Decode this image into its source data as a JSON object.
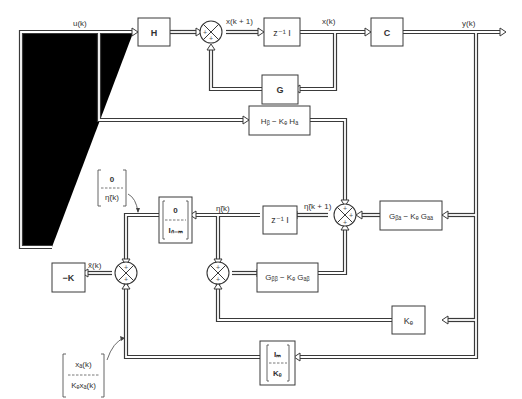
{
  "diagram": {
    "type": "block-diagram",
    "title": "",
    "blocks": {
      "H": "H",
      "zinv_top": "z⁻¹ I",
      "C": "C",
      "G": "G",
      "Hb_KeHa": "Hᵦ − Kₑ Hₐ",
      "Gba_KeGaa": "Gᵦₐ − Kₑ Gₐₐ",
      "zinv_mid": "z⁻¹ I",
      "Gbb_KeGab": "Gᵦᵦ − Kₑ Gₐᵦ",
      "minusK": "−K",
      "Ke": "Kₑ",
      "stack0I_top": "0",
      "stack0I_bot": "Iₙ₋ₘ",
      "stackIK_top": "Iₘ",
      "stackIK_bot": "Kₑ"
    },
    "signals": {
      "u": "u(k)",
      "x_next": "x(k + 1)",
      "x": "x(k)",
      "y": "y(k)",
      "eta_next": "η̃(k + 1)",
      "eta": "η̃(k)",
      "x_hat": "x̃(k)"
    },
    "annotations": {
      "ann1_top": "0",
      "ann1_bot": "η̃(k)",
      "ann2_top": "xₐ(k)",
      "ann2_bot": "Kₑxₐ(k)"
    },
    "summing_junction_sign": "+",
    "colors": {
      "line": "#3a3a3a",
      "background": "#ffffff"
    }
  }
}
